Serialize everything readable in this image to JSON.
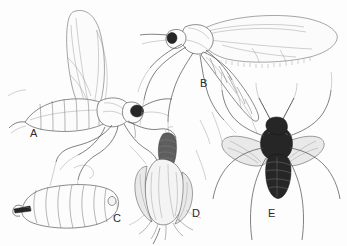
{
  "plate": {
    "width": 347,
    "height": 246,
    "background_color": "#fdfdfd",
    "style": "pen-and-ink scientific line drawing",
    "ink_color": "#4a4a4a",
    "dark_color": "#262626"
  },
  "panels": [
    {
      "label": "A",
      "label_x": 30,
      "label_y": 128,
      "subject": "adult-midge-lateral",
      "description": "adult gall midge in lateral view with raised wing, segmented abdomen, long legs and antenna",
      "features": [
        "raised-wing",
        "segmented-abdomen",
        "compound-eye",
        "long-legs",
        "antenna"
      ]
    },
    {
      "label": "B",
      "label_x": 200,
      "label_y": 78,
      "subject": "adult-midge-lateral-winged",
      "description": "adult midge in lateral view with outstretched fringed wing and tapering abdomen",
      "features": [
        "outstretched-wing",
        "fringed-wing-margin",
        "tapered-abdomen",
        "long-legs"
      ]
    },
    {
      "label": "C",
      "label_x": 113,
      "label_y": 213,
      "subject": "larva-lateral",
      "description": "segmented larva in lateral view with dark sternal spatula at the anterior end",
      "features": [
        "body-segments",
        "sternal-spatula",
        "rounded-posterior"
      ]
    },
    {
      "label": "D",
      "label_x": 192,
      "label_y": 208,
      "subject": "pupa-in-bud",
      "description": "pupa protruding from the tip of an infested plant bud or grass spikelet",
      "features": [
        "pupa",
        "plant-bud",
        "bracts",
        "emergence"
      ]
    },
    {
      "label": "E",
      "label_x": 268,
      "label_y": 208,
      "subject": "adult-midge-dorsal",
      "description": "adult midge in dorsal view with dark banded abdomen and spread grey wings",
      "features": [
        "dorsal-view",
        "spread-wings",
        "banded-abdomen",
        "antennae",
        "splayed-legs"
      ]
    }
  ]
}
